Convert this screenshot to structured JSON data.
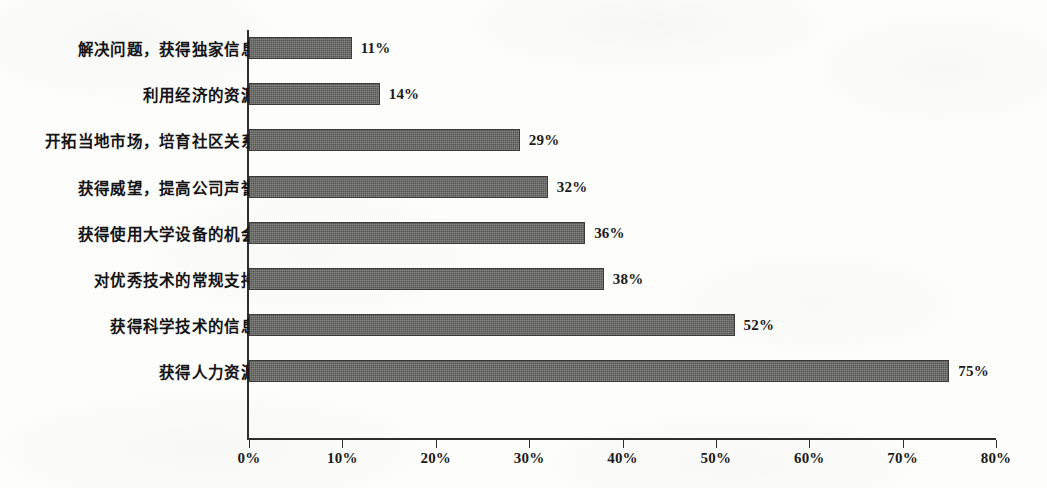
{
  "chart_data": {
    "type": "bar",
    "orientation": "horizontal",
    "title": "",
    "subtitle": "",
    "xlabel": "",
    "ylabel": "",
    "xlim": [
      0,
      80
    ],
    "grid": false,
    "legend": null,
    "value_suffix": "%",
    "categories": [
      "解决问题，获得独家信息",
      "利用经济的资源",
      "开拓当地市场，培育社区关系",
      "获得威望，提高公司声誉",
      "获得使用大学设备的机会",
      "对优秀技术的常规支持",
      "获得科学技术的信息",
      "获得人力资源"
    ],
    "values": [
      11,
      14,
      29,
      32,
      36,
      38,
      52,
      75
    ],
    "data_labels": [
      "11%",
      "14%",
      "29%",
      "32%",
      "36%",
      "38%",
      "52%",
      "75%"
    ],
    "xticks": [
      0,
      10,
      20,
      30,
      40,
      50,
      60,
      70,
      80
    ],
    "xtick_labels": [
      "0%",
      "10%",
      "20%",
      "30%",
      "40%",
      "50%",
      "60%",
      "70%",
      "80%"
    ],
    "colors": {
      "bar_fill": "#555552",
      "bar_border": "#3b3b39",
      "axis": "#2e2e2e",
      "text": "#141414",
      "background": "#fdfdfc"
    }
  }
}
